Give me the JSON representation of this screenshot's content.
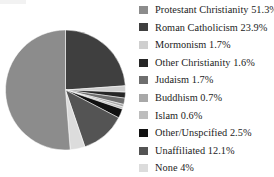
{
  "chart_data": {
    "type": "pie",
    "title": "",
    "start_angle_deg": 0,
    "direction": "clockwise",
    "legend_position": "right",
    "grid": false,
    "unit": "%",
    "categories": [
      "Protestant Christianity",
      "Roman Catholicism",
      "Mormonism",
      "Other Christianity",
      "Judaism",
      "Buddhism",
      "Islam",
      "Other/Unspcified",
      "Unaffiliated",
      "None"
    ],
    "values": [
      51.3,
      23.9,
      1.7,
      1.6,
      1.7,
      0.7,
      0.6,
      2.5,
      12.1,
      4
    ],
    "value_labels": [
      "51.3%",
      "23.9%",
      "1.7%",
      "1.6%",
      "1.7%",
      "0.7%",
      "0.6%",
      "2.5%",
      "12.1%",
      "4%"
    ],
    "colors": [
      "#8c8c8c",
      "#3f3f3f",
      "#cfcfcf",
      "#262626",
      "#6e6e6e",
      "#a8a8a8",
      "#bdbdbd",
      "#111111",
      "#545454",
      "#dcdcdc"
    ],
    "slice_order_clockwise_from_top": [
      "Roman Catholicism",
      "Mormonism",
      "Other Christianity",
      "Judaism",
      "Buddhism",
      "Islam",
      "Other/Unspcified",
      "Unaffiliated",
      "None",
      "Protestant Christianity"
    ]
  },
  "legend": {
    "items": [
      {
        "label": "Protestant Christianity 51.3%",
        "name": "Protestant Christianity",
        "value": "51.3%",
        "color": "#8c8c8c"
      },
      {
        "label": "Roman Catholicism 23.9%",
        "name": "Roman Catholicism",
        "value": "23.9%",
        "color": "#3f3f3f"
      },
      {
        "label": "Mormonism 1.7%",
        "name": "Mormonism",
        "value": "1.7%",
        "color": "#cfcfcf"
      },
      {
        "label": "Other Christianity 1.6%",
        "name": "Other Christianity",
        "value": "1.6%",
        "color": "#262626"
      },
      {
        "label": "Judaism 1.7%",
        "name": "Judaism",
        "value": "1.7%",
        "color": "#6e6e6e"
      },
      {
        "label": "Buddhism 0.7%",
        "name": "Buddhism",
        "value": "0.7%",
        "color": "#a8a8a8"
      },
      {
        "label": "Islam 0.6%",
        "name": "Islam",
        "value": "0.6%",
        "color": "#bdbdbd"
      },
      {
        "label": "Other/Unspcified 2.5%",
        "name": "Other/Unspcified",
        "value": "2.5%",
        "color": "#111111"
      },
      {
        "label": "Unaffiliated 12.1%",
        "name": "Unaffiliated",
        "value": "12.1%",
        "color": "#545454"
      },
      {
        "label": "None 4%",
        "name": "None",
        "value": "4%",
        "color": "#dcdcdc"
      }
    ]
  }
}
